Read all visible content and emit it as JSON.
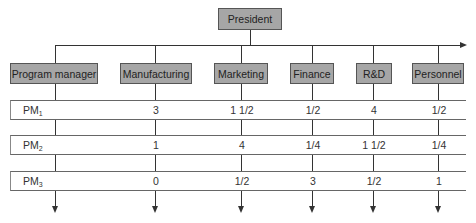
{
  "top": {
    "label": "President"
  },
  "departments": [
    {
      "label": "Program manager",
      "x": 55
    },
    {
      "label": "Manufacturing",
      "x": 155
    },
    {
      "label": "Marketing",
      "x": 241
    },
    {
      "label": "Finance",
      "x": 312
    },
    {
      "label": "R&D",
      "x": 373
    },
    {
      "label": "Personnel",
      "x": 438
    }
  ],
  "rows": [
    {
      "label": "PM",
      "sub": "1",
      "values": [
        "3",
        "1 1/2",
        "1/2",
        "4",
        "1/2"
      ]
    },
    {
      "label": "PM",
      "sub": "2",
      "values": [
        "1",
        "4",
        "1/4",
        "1 1/2",
        "1/4"
      ]
    },
    {
      "label": "PM",
      "sub": "3",
      "values": [
        "0",
        "1/2",
        "3",
        "1/2",
        "1"
      ]
    }
  ]
}
